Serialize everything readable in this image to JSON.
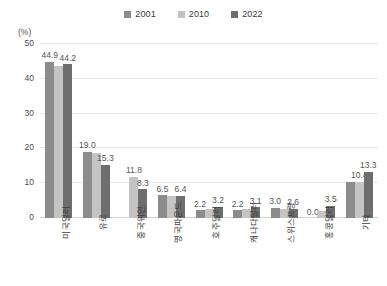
{
  "chart_data": {
    "type": "bar",
    "title": "",
    "subtitle": "",
    "unit_label": "(%)",
    "xlabel": "",
    "ylabel": "",
    "ylim": [
      0,
      50
    ],
    "yticks": [
      0,
      10,
      20,
      30,
      40,
      50
    ],
    "grid": true,
    "legend_position": "top-center",
    "categories": [
      "미국달러",
      "유로",
      "중국위안",
      "영국파운드",
      "호주달러",
      "캐나다달러",
      "스위스프랑",
      "홍콩달러",
      "기타"
    ],
    "series": [
      {
        "name": "2001",
        "color": "#8c8c8c",
        "values": [
          44.9,
          19.0,
          0.0,
          6.5,
          2.2,
          2.2,
          3.0,
          0.0,
          10.4
        ],
        "labels": [
          "44.9",
          "19.0",
          "",
          "6.5",
          "2.2",
          "2.2",
          "3.0",
          "0.0",
          ""
        ]
      },
      {
        "name": "2010",
        "color": "#c4c4c4",
        "values": [
          43.6,
          18.6,
          11.8,
          6.3,
          2.6,
          2.6,
          2.7,
          2.1,
          10.4
        ],
        "labels": [
          "",
          "",
          "11.8",
          "",
          "",
          "",
          "",
          "",
          "10.4"
        ]
      },
      {
        "name": "2022",
        "color": "#6e6e6e",
        "values": [
          44.2,
          15.3,
          8.3,
          6.4,
          3.2,
          3.1,
          2.6,
          3.5,
          13.3
        ],
        "labels": [
          "44.2",
          "15.3",
          "8.3",
          "6.4",
          "3.2",
          "3.1",
          "2.6",
          "3.5",
          "13.3"
        ]
      }
    ]
  },
  "legend": {
    "items": [
      {
        "label": "2001",
        "color": "#8c8c8c"
      },
      {
        "label": "2010",
        "color": "#c4c4c4"
      },
      {
        "label": "2022",
        "color": "#6e6e6e"
      }
    ]
  }
}
